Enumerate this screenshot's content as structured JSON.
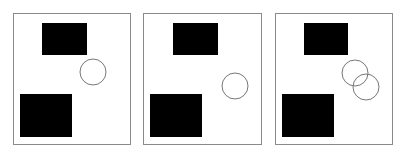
{
  "colors": {
    "border": "#8a8a8a",
    "fill": "#000000",
    "circle": "#777777",
    "background": "#ffffff"
  },
  "panels": [
    {
      "frame": {
        "x": 13,
        "y": 13,
        "w": 117,
        "h": 131
      },
      "rects": [
        {
          "x": 42,
          "y": 23,
          "w": 45,
          "h": 32
        },
        {
          "x": 20,
          "y": 94,
          "w": 52,
          "h": 43
        }
      ],
      "circles": [
        {
          "cx": 93,
          "cy": 72,
          "r": 13
        }
      ]
    },
    {
      "frame": {
        "x": 143,
        "y": 13,
        "w": 118,
        "h": 131
      },
      "rects": [
        {
          "x": 173,
          "y": 23,
          "w": 45,
          "h": 32
        },
        {
          "x": 150,
          "y": 94,
          "w": 52,
          "h": 43
        }
      ],
      "circles": [
        {
          "cx": 235,
          "cy": 86,
          "r": 13
        }
      ]
    },
    {
      "frame": {
        "x": 275,
        "y": 13,
        "w": 117,
        "h": 131
      },
      "rects": [
        {
          "x": 304,
          "y": 23,
          "w": 44,
          "h": 32
        },
        {
          "x": 282,
          "y": 94,
          "w": 52,
          "h": 43
        }
      ],
      "circles": [
        {
          "cx": 355,
          "cy": 73,
          "r": 13
        },
        {
          "cx": 366,
          "cy": 87,
          "r": 13
        }
      ]
    }
  ]
}
